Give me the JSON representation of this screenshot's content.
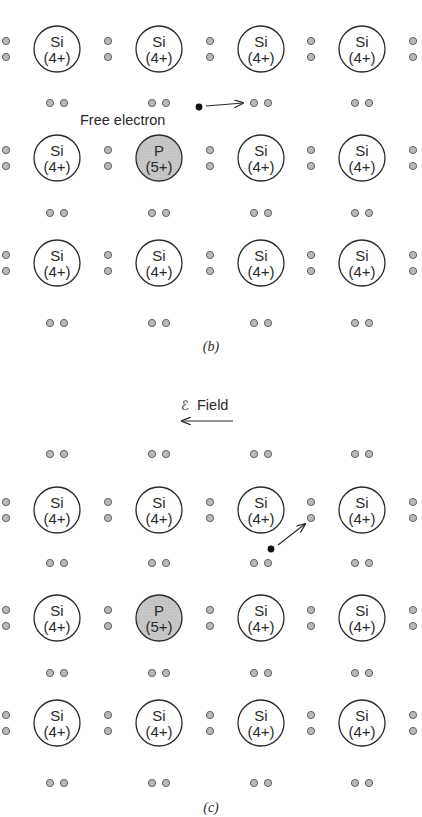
{
  "colors": {
    "ink": "#2a2a2a",
    "electron_fill": "#b9b9b9",
    "electron_stroke": "#555555",
    "donor_fill": "#c8c8c8",
    "si_fill": "#ffffff",
    "free_electron": "#111111"
  },
  "panels": [
    {
      "id": "b",
      "caption": "(b)",
      "annotation": {
        "label": "Free electron"
      },
      "rows": [
        [
          {
            "symbol": "Si",
            "charge": "(4+)"
          },
          {
            "symbol": "Si",
            "charge": "(4+)"
          },
          {
            "symbol": "Si",
            "charge": "(4+)"
          },
          {
            "symbol": "Si",
            "charge": "(4+)"
          }
        ],
        [
          {
            "symbol": "Si",
            "charge": "(4+)"
          },
          {
            "symbol": "P",
            "charge": "(5+)"
          },
          {
            "symbol": "Si",
            "charge": "(4+)"
          },
          {
            "symbol": "Si",
            "charge": "(4+)"
          }
        ],
        [
          {
            "symbol": "Si",
            "charge": "(4+)"
          },
          {
            "symbol": "Si",
            "charge": "(4+)"
          },
          {
            "symbol": "Si",
            "charge": "(4+)"
          },
          {
            "symbol": "Si",
            "charge": "(4+)"
          }
        ]
      ]
    },
    {
      "id": "c",
      "caption": "(c)",
      "field": {
        "symbol": "ℰ",
        "label": "Field",
        "direction": "left"
      },
      "rows": [
        [
          {
            "symbol": "Si",
            "charge": "(4+)"
          },
          {
            "symbol": "Si",
            "charge": "(4+)"
          },
          {
            "symbol": "Si",
            "charge": "(4+)"
          },
          {
            "symbol": "Si",
            "charge": "(4+)"
          }
        ],
        [
          {
            "symbol": "Si",
            "charge": "(4+)"
          },
          {
            "symbol": "P",
            "charge": "(5+)"
          },
          {
            "symbol": "Si",
            "charge": "(4+)"
          },
          {
            "symbol": "Si",
            "charge": "(4+)"
          }
        ],
        [
          {
            "symbol": "Si",
            "charge": "(4+)"
          },
          {
            "symbol": "Si",
            "charge": "(4+)"
          },
          {
            "symbol": "Si",
            "charge": "(4+)"
          },
          {
            "symbol": "Si",
            "charge": "(4+)"
          }
        ]
      ]
    }
  ]
}
